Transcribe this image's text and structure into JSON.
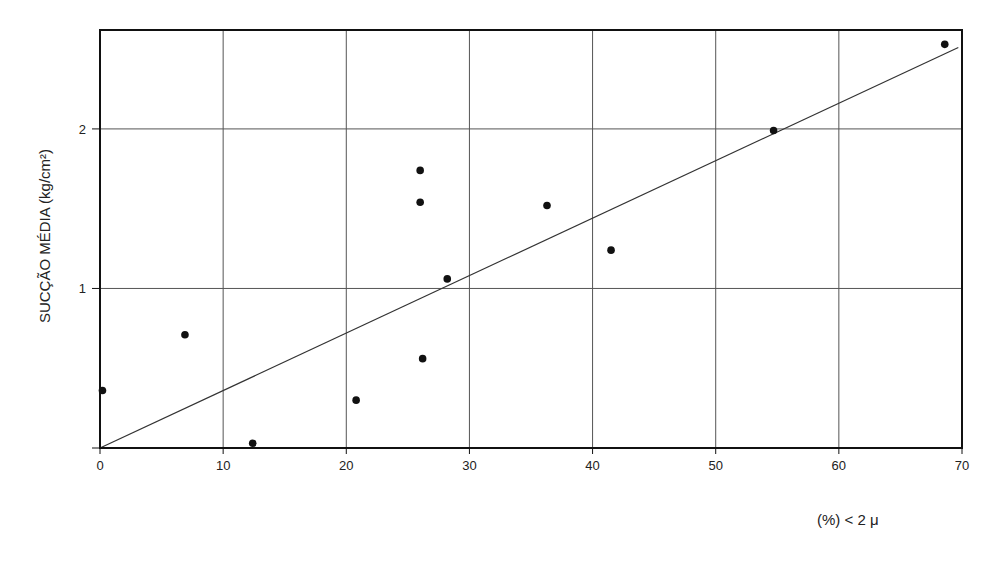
{
  "chart_data": {
    "type": "scatter",
    "title": "",
    "xlabel": "(%) < 2 μ",
    "ylabel": "SUCÇÃO MÉDIA (kg/cm²)",
    "xlim": [
      0,
      70
    ],
    "ylim": [
      0,
      2.62
    ],
    "xticks": [
      0,
      10,
      20,
      30,
      40,
      50,
      60,
      70
    ],
    "yticks": [
      1,
      2
    ],
    "grid": true,
    "legend": null,
    "series": [
      {
        "name": "amostras",
        "marker": "filled-circle",
        "color": "#111111",
        "points": [
          {
            "x": 0.2,
            "y": 0.36
          },
          {
            "x": 6.9,
            "y": 0.71
          },
          {
            "x": 12.4,
            "y": 0.03
          },
          {
            "x": 20.8,
            "y": 0.3
          },
          {
            "x": 26.0,
            "y": 1.74
          },
          {
            "x": 26.0,
            "y": 1.54
          },
          {
            "x": 26.2,
            "y": 0.56
          },
          {
            "x": 28.2,
            "y": 1.06
          },
          {
            "x": 36.3,
            "y": 1.52
          },
          {
            "x": 41.5,
            "y": 1.24
          },
          {
            "x": 54.7,
            "y": 1.99
          },
          {
            "x": 68.6,
            "y": 2.53
          }
        ]
      }
    ],
    "trendline": {
      "type": "linear",
      "from": {
        "x": 0,
        "y": 0
      },
      "to": {
        "x": 69.7,
        "y": 2.51
      },
      "color": "#333333"
    }
  },
  "colors": {
    "frame": "#111111",
    "grid": "#555555",
    "text": "#222222",
    "background": "#ffffff"
  }
}
